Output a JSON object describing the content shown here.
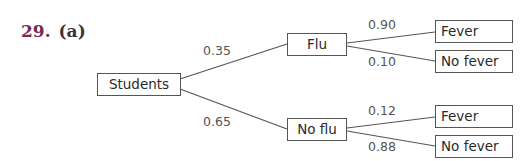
{
  "heading": {
    "number": "29.",
    "part": "(a)"
  },
  "colors": {
    "number": "#7a2a4f",
    "line": "#555555",
    "text": "#2a2a2a"
  },
  "tree": {
    "root": {
      "label": "Students"
    },
    "branches": [
      {
        "label": "Flu",
        "probability": "0.35",
        "children": [
          {
            "label": "Fever",
            "probability": "0.90"
          },
          {
            "label": "No fever",
            "probability": "0.10"
          }
        ]
      },
      {
        "label": "No flu",
        "probability": "0.65",
        "children": [
          {
            "label": "Fever",
            "probability": "0.12"
          },
          {
            "label": "No fever",
            "probability": "0.88"
          }
        ]
      }
    ]
  }
}
